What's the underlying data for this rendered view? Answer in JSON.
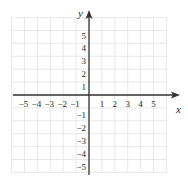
{
  "diagram": {
    "type": "coordinate-plane",
    "x_axis_label": "x",
    "y_axis_label": "y",
    "x_range": [
      -6,
      6
    ],
    "y_range": [
      -6,
      6
    ],
    "grid": true,
    "x_tick_labels": [
      "−5",
      "−4",
      "−3",
      "−2",
      "−1",
      "1",
      "2",
      "3",
      "4",
      "5"
    ],
    "x_tick_values": [
      -5,
      -4,
      -3,
      -2,
      -1,
      1,
      2,
      3,
      4,
      5
    ],
    "y_tick_labels": [
      "5",
      "4",
      "3",
      "2",
      "1",
      "−1",
      "−2",
      "−3",
      "−4",
      "−5"
    ],
    "y_tick_values": [
      5,
      4,
      3,
      2,
      1,
      -1,
      -2,
      -3,
      -4,
      -5
    ],
    "colors": {
      "grid": "#e2e2e2",
      "axis": "#333333",
      "text": "#2a2a2a",
      "background": "#ffffff"
    }
  }
}
